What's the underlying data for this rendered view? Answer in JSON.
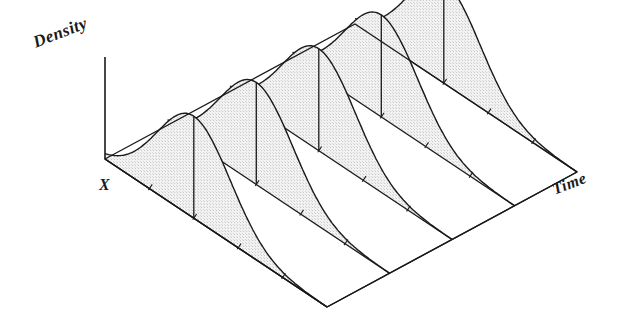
{
  "figure": {
    "type": "3d-ridgeline-density-over-time",
    "background_color": "#ffffff",
    "line_color": "#1a1a1a",
    "fill_color": "#e9e9e9",
    "axes": {
      "vertical": {
        "name": "density-axis",
        "label": "Density"
      },
      "depth": {
        "name": "x-axis",
        "label": "X"
      },
      "horizontal": {
        "name": "time-axis",
        "label": "Time"
      }
    }
  },
  "chart_data": {
    "type": "area",
    "title": "",
    "xlabel": "X",
    "ylabel": "Density",
    "zlabel": "Time",
    "grid": false,
    "legend": null,
    "annotations": [
      "Density",
      "X",
      "Time"
    ],
    "series": [
      {
        "name": "t1",
        "time": 1,
        "peak_x": 0.4,
        "peak_height": 1.0,
        "sigma": 0.165
      },
      {
        "name": "t2",
        "time": 2,
        "peak_x": 0.4,
        "peak_height": 1.0,
        "sigma": 0.165
      },
      {
        "name": "t3",
        "time": 3,
        "peak_x": 0.4,
        "peak_height": 1.0,
        "sigma": 0.165
      },
      {
        "name": "t4",
        "time": 4,
        "peak_x": 0.4,
        "peak_height": 1.0,
        "sigma": 0.165
      },
      {
        "name": "t5",
        "time": 5,
        "peak_x": 0.4,
        "peak_height": 1.0,
        "sigma": 0.165
      }
    ],
    "categories": [
      "t1",
      "t2",
      "t3",
      "t4",
      "t5"
    ],
    "values": [
      1.0,
      1.0,
      1.0,
      1.0,
      1.0
    ],
    "xlim": [
      0,
      1
    ],
    "ylim": [
      0,
      1
    ],
    "zlim": [
      1,
      5
    ],
    "ticks_per_baseline": 4
  },
  "geometry": {
    "origin": [
      105,
      159
    ],
    "x_axis_end": [
      327,
      307
    ],
    "time_axis_end": [
      577,
      172
    ],
    "back_corner": [
      291,
      27
    ],
    "density_axis_top": [
      105,
      57
    ],
    "baselines": 5
  }
}
